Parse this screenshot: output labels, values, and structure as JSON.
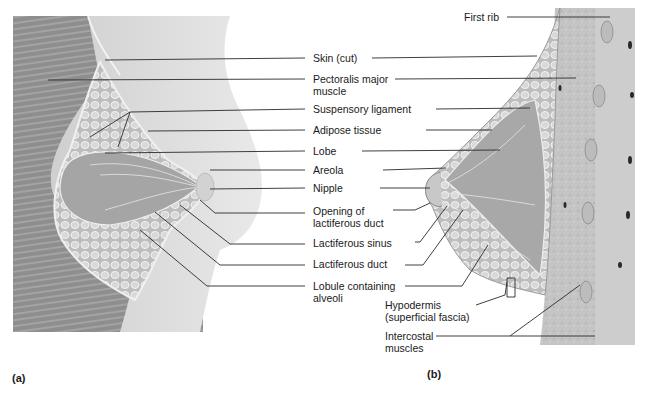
{
  "figure": {
    "panels": [
      {
        "id": "a",
        "caption": "(a)"
      },
      {
        "id": "b",
        "caption": "(b)"
      }
    ],
    "labels": {
      "skin_cut": "Skin (cut)",
      "pectoralis_1": "Pectoralis major",
      "pectoralis_2": "muscle",
      "suspensory": "Suspensory ligament",
      "adipose": "Adipose tissue",
      "lobe": "Lobe",
      "areola": "Areola",
      "nipple": "Nipple",
      "opening_1": "Opening of",
      "opening_2": "lactiferous duct",
      "sinus": "Lactiferous sinus",
      "duct": "Lactiferous duct",
      "lobule_1": "Lobule containing",
      "lobule_2": "alveoli",
      "first_rib": "First rib",
      "hypodermis_1": "Hypodermis",
      "hypodermis_2": "(superficial fascia)",
      "intercostal_1": "Intercostal",
      "intercostal_2": "muscles"
    },
    "colors": {
      "line": "#2a2a2a",
      "muscle": "#8a8a8a",
      "skin": "#d9d9d9",
      "gland": "#a8a8a8",
      "fat": "#c8c8c8"
    }
  }
}
